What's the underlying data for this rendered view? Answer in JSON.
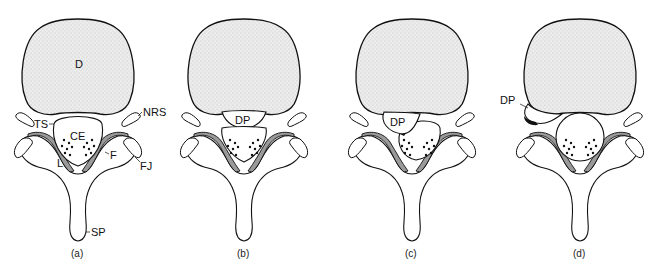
{
  "figure": {
    "colors": {
      "outline": "#111111",
      "disc_fill": "#e6e6e6",
      "ligament_fill": "#9a9a9a",
      "background": "#ffffff",
      "prolapse_dark": "#111111"
    },
    "panels": [
      {
        "caption": "(a)",
        "labels": {
          "disc": "D",
          "nerve_root_sleeve": "NRS",
          "thecal_sac": "TS",
          "cauda_equina": "CE",
          "lamina": "L",
          "ligamentum_flavum": "F",
          "facet_joint": "FJ",
          "spinous_process": "SP"
        }
      },
      {
        "caption": "(b)",
        "labels": {
          "disc_prolapse": "DP"
        }
      },
      {
        "caption": "(c)",
        "labels": {
          "disc_prolapse": "DP"
        }
      },
      {
        "caption": "(d)",
        "labels": {
          "disc_prolapse": "DP"
        }
      }
    ]
  }
}
